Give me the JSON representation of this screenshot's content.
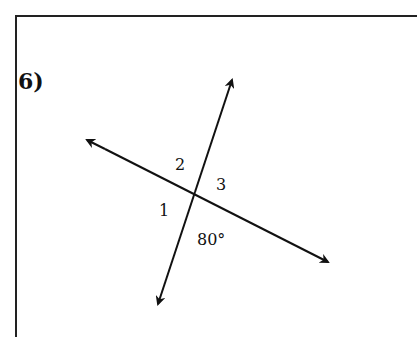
{
  "problem": {
    "number": "6)"
  },
  "labels": {
    "angle1": "1",
    "angle2": "2",
    "angle3": "3",
    "given": "80°"
  },
  "lines": {
    "line_a": {
      "from": [
        328,
        262
      ],
      "to": [
        87,
        140
      ]
    },
    "line_b": {
      "from": [
        158,
        304
      ],
      "to": [
        232,
        80
      ]
    }
  },
  "colors": {
    "stroke": "#111111"
  }
}
